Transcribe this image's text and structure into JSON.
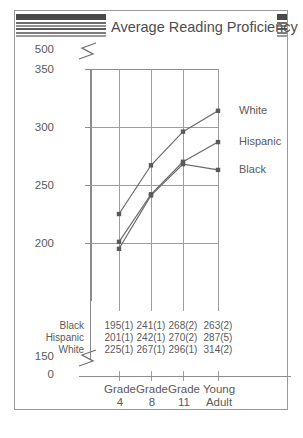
{
  "figure": {
    "title": "Average Reading Proficiency"
  },
  "chart_data": {
    "type": "line",
    "title": "Average Reading Proficiency",
    "xlabel": "",
    "ylabel": "",
    "categories": [
      "Grade 4",
      "Grade 8",
      "Grade 11",
      "Young Adult"
    ],
    "category_lines": [
      [
        "Grade",
        "4"
      ],
      [
        "Grade",
        "8"
      ],
      [
        "Grade",
        "11"
      ],
      [
        "Young",
        "Adult"
      ]
    ],
    "ylim": [
      150,
      350
    ],
    "yticks": [
      "500",
      "350",
      "300",
      "250",
      "200",
      "150",
      "0"
    ],
    "ytick_values": [
      500,
      350,
      300,
      250,
      200,
      150,
      0
    ],
    "axis_break_top": true,
    "axis_break_bottom": true,
    "grid": true,
    "legend_position": "right-of-line-ends",
    "series": [
      {
        "name": "Black",
        "values": [
          195,
          241,
          268,
          263
        ],
        "standard_errors": [
          1,
          1,
          2,
          2
        ],
        "labels": [
          "195(1)",
          "241(1)",
          "268(2)",
          "263(2)"
        ]
      },
      {
        "name": "Hispanic",
        "values": [
          201,
          242,
          270,
          287
        ],
        "standard_errors": [
          1,
          1,
          2,
          5
        ],
        "labels": [
          "201(1)",
          "242(1)",
          "270(2)",
          "287(5)"
        ]
      },
      {
        "name": "White",
        "values": [
          225,
          267,
          296,
          314
        ],
        "standard_errors": [
          1,
          1,
          1,
          2
        ],
        "labels": [
          "225(1)",
          "267(1)",
          "296(1)",
          "314(2)"
        ]
      }
    ]
  }
}
